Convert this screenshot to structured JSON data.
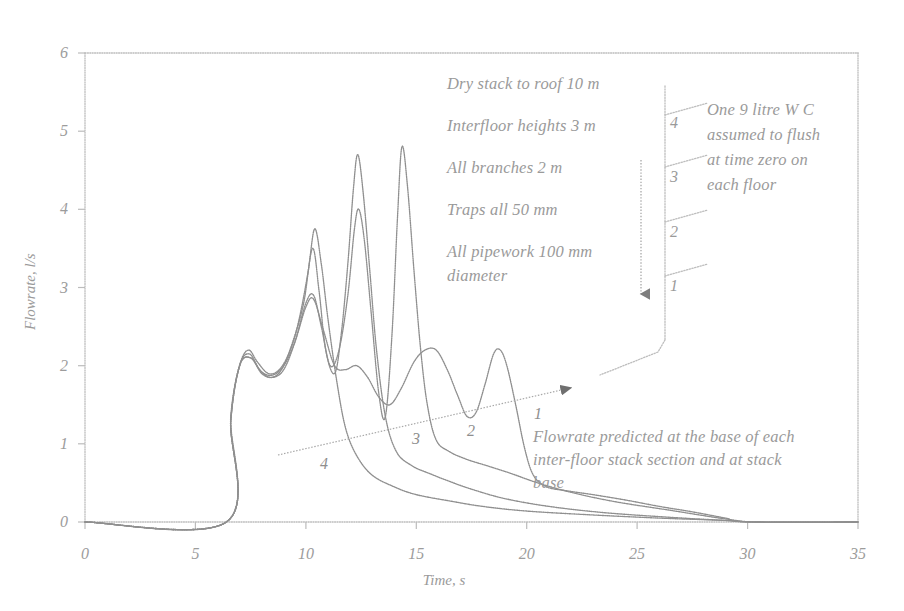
{
  "chart_data": {
    "type": "line",
    "title": "",
    "xlabel": "Time, s",
    "ylabel": "Flowrate, l/s",
    "xlim": [
      0,
      35
    ],
    "ylim": [
      0,
      6
    ],
    "xticks": [
      "0",
      "5",
      "10",
      "15",
      "20",
      "25",
      "30",
      "35"
    ],
    "yticks": [
      "0",
      "1",
      "2",
      "3",
      "4",
      "5",
      "6"
    ],
    "grid": false,
    "legend": "inline-labels",
    "series": [
      {
        "name": "4",
        "label": "4",
        "description": "Flowrate at base of stack section below floor 4 (topmost)",
        "points": [
          [
            0,
            0
          ],
          [
            6.4,
            0
          ],
          [
            6.6,
            1.35
          ],
          [
            7.0,
            2.0
          ],
          [
            7.4,
            2.2
          ],
          [
            7.8,
            2.05
          ],
          [
            8.3,
            1.9
          ],
          [
            8.8,
            1.95
          ],
          [
            9.3,
            2.2
          ],
          [
            9.7,
            2.6
          ],
          [
            10.1,
            3.2
          ],
          [
            10.4,
            3.75
          ],
          [
            10.7,
            3.3
          ],
          [
            11.0,
            2.6
          ],
          [
            11.4,
            1.8
          ],
          [
            11.8,
            1.2
          ],
          [
            12.3,
            0.85
          ],
          [
            13.0,
            0.6
          ],
          [
            14.0,
            0.45
          ],
          [
            15.0,
            0.35
          ],
          [
            16.5,
            0.27
          ],
          [
            18.0,
            0.2
          ],
          [
            20.0,
            0.14
          ],
          [
            23.0,
            0.09
          ],
          [
            26.0,
            0.05
          ],
          [
            29.0,
            0.02
          ],
          [
            30.5,
            0.0
          ],
          [
            35,
            0.0
          ]
        ]
      },
      {
        "name": "3",
        "label": "3",
        "description": "Flowrate at base of stack section below floor 3",
        "points": [
          [
            0,
            0
          ],
          [
            6.4,
            0
          ],
          [
            6.6,
            1.3
          ],
          [
            7.0,
            2.0
          ],
          [
            7.45,
            2.15
          ],
          [
            7.9,
            1.95
          ],
          [
            8.4,
            1.85
          ],
          [
            8.9,
            1.95
          ],
          [
            9.4,
            2.3
          ],
          [
            9.9,
            2.8
          ],
          [
            10.3,
            3.5
          ],
          [
            10.6,
            2.95
          ],
          [
            10.9,
            2.2
          ],
          [
            11.3,
            1.9
          ],
          [
            11.6,
            2.4
          ],
          [
            11.9,
            3.3
          ],
          [
            12.15,
            4.25
          ],
          [
            12.35,
            4.7
          ],
          [
            12.6,
            4.2
          ],
          [
            12.9,
            3.2
          ],
          [
            13.2,
            2.2
          ],
          [
            13.6,
            1.35
          ],
          [
            14.1,
            0.9
          ],
          [
            14.8,
            0.72
          ],
          [
            15.6,
            0.62
          ],
          [
            16.5,
            0.52
          ],
          [
            17.5,
            0.42
          ],
          [
            19.0,
            0.3
          ],
          [
            21.0,
            0.2
          ],
          [
            23.5,
            0.12
          ],
          [
            26.5,
            0.06
          ],
          [
            29.0,
            0.02
          ],
          [
            30.5,
            0.0
          ],
          [
            35,
            0.0
          ]
        ]
      },
      {
        "name": "2",
        "label": "2",
        "description": "Flowrate at base of stack section below floor 2",
        "points": [
          [
            0,
            0
          ],
          [
            6.4,
            0
          ],
          [
            6.6,
            1.3
          ],
          [
            7.0,
            2.0
          ],
          [
            7.5,
            2.1
          ],
          [
            8.0,
            1.9
          ],
          [
            8.5,
            1.85
          ],
          [
            9.0,
            1.95
          ],
          [
            9.5,
            2.3
          ],
          [
            10.0,
            2.8
          ],
          [
            10.35,
            2.9
          ],
          [
            10.7,
            2.5
          ],
          [
            11.1,
            2.0
          ],
          [
            11.5,
            2.2
          ],
          [
            11.9,
            2.9
          ],
          [
            12.2,
            3.75
          ],
          [
            12.4,
            4.0
          ],
          [
            12.65,
            3.6
          ],
          [
            12.95,
            2.7
          ],
          [
            13.3,
            1.65
          ],
          [
            13.6,
            1.35
          ],
          [
            13.9,
            2.4
          ],
          [
            14.15,
            3.9
          ],
          [
            14.35,
            4.8
          ],
          [
            14.6,
            4.3
          ],
          [
            14.9,
            3.2
          ],
          [
            15.2,
            2.2
          ],
          [
            15.5,
            1.5
          ],
          [
            15.9,
            1.05
          ],
          [
            16.5,
            0.9
          ],
          [
            17.3,
            0.8
          ],
          [
            18.2,
            0.72
          ],
          [
            19.3,
            0.62
          ],
          [
            20.5,
            0.5
          ],
          [
            22.0,
            0.38
          ],
          [
            24.0,
            0.26
          ],
          [
            26.5,
            0.15
          ],
          [
            29.0,
            0.04
          ],
          [
            30.5,
            0.0
          ],
          [
            35,
            0.0
          ]
        ]
      },
      {
        "name": "1",
        "label": "1",
        "description": "Flowrate at stack base (ground floor section)",
        "points": [
          [
            0,
            0
          ],
          [
            6.4,
            0
          ],
          [
            6.6,
            1.3
          ],
          [
            7.0,
            2.0
          ],
          [
            7.5,
            2.1
          ],
          [
            8.0,
            1.92
          ],
          [
            8.5,
            1.88
          ],
          [
            9.0,
            2.0
          ],
          [
            9.5,
            2.3
          ],
          [
            10.0,
            2.75
          ],
          [
            10.35,
            2.85
          ],
          [
            10.8,
            2.45
          ],
          [
            11.3,
            2.0
          ],
          [
            11.8,
            1.95
          ],
          [
            12.3,
            2.0
          ],
          [
            12.8,
            1.85
          ],
          [
            13.3,
            1.6
          ],
          [
            13.8,
            1.5
          ],
          [
            14.3,
            1.7
          ],
          [
            14.9,
            2.05
          ],
          [
            15.4,
            2.2
          ],
          [
            15.9,
            2.2
          ],
          [
            16.4,
            1.95
          ],
          [
            16.9,
            1.6
          ],
          [
            17.3,
            1.35
          ],
          [
            17.7,
            1.4
          ],
          [
            18.1,
            1.75
          ],
          [
            18.5,
            2.15
          ],
          [
            18.8,
            2.2
          ],
          [
            19.1,
            2.0
          ],
          [
            19.5,
            1.5
          ],
          [
            19.9,
            0.95
          ],
          [
            20.3,
            0.6
          ],
          [
            20.9,
            0.45
          ],
          [
            21.8,
            0.4
          ],
          [
            23.0,
            0.35
          ],
          [
            24.5,
            0.28
          ],
          [
            26.0,
            0.2
          ],
          [
            27.5,
            0.13
          ],
          [
            29.0,
            0.05
          ],
          [
            30.0,
            0.0
          ],
          [
            35,
            0.0
          ]
        ]
      }
    ],
    "curve_labels": [
      {
        "label": "4",
        "x": 324,
        "y": 465
      },
      {
        "label": "3",
        "x": 415,
        "y": 440
      },
      {
        "label": "2",
        "x": 470,
        "y": 432
      },
      {
        "label": "1",
        "x": 537,
        "y": 417
      }
    ],
    "annotations": {
      "parameters": [
        "Dry stack to roof 10 m",
        "Interfloor heights 3 m",
        "All branches 2 m",
        "Traps all 50 mm",
        "All pipework 100 mm",
        "diameter"
      ],
      "stack_note": [
        "One 9 litre W C",
        "assumed to flush",
        "at time zero on",
        "each floor"
      ],
      "flow_note": [
        "Flowrate predicted at the base of each",
        "inter-floor stack section and at stack",
        "base"
      ],
      "floor_numbers": [
        "4",
        "3",
        "2",
        "1"
      ]
    }
  },
  "colors": {
    "axis": "#b9b9b9",
    "curve": "#8f8f8f",
    "text": "#9a9a9a",
    "schematic": "#b5b5b5",
    "background": "#ffffff"
  }
}
